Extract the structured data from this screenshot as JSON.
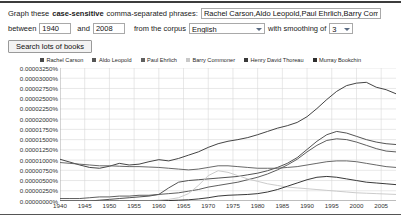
{
  "form": {
    "label_prefix": "Graph these",
    "label_bold": "case-sensitive",
    "label_suffix": "comma-separated phrases:",
    "phrase_value": "Rachel Carson,Aldo Leopold,Paul Ehrlich,Barry Commoner,Henry D",
    "phrase_placeholder": "",
    "between_label": "between",
    "start_year": "1940",
    "and_label": "and",
    "end_year": "2008",
    "corpus_label": "from the corpus",
    "corpus_value": "English",
    "corpus_options": [
      "English"
    ],
    "smoothing_label": "with smoothing of",
    "smoothing_value": "3",
    "smoothing_options": [
      "3"
    ],
    "search_button": "Search lots of books"
  },
  "legend": [
    {
      "label": "Rachel Carson",
      "color": "#4a4a4a"
    },
    {
      "label": "Aldo Leopold",
      "color": "#555555"
    },
    {
      "label": "Paul Ehrlich",
      "color": "#606060"
    },
    {
      "label": "Barry Commoner",
      "color": "#c8c8c8"
    },
    {
      "label": "Henry David Thoreau",
      "color": "#3a3a3a"
    },
    {
      "label": "Murray Bookchin",
      "color": "#2e2e2e"
    }
  ],
  "chart_data": {
    "type": "line",
    "title": "",
    "xlabel": "",
    "ylabel": "",
    "grid": true,
    "legend_position": "top",
    "xlim": [
      1940,
      2008
    ],
    "ylim": [
      0.0,
      3.25e-05
    ],
    "x_ticks": [
      1940,
      1945,
      1950,
      1955,
      1960,
      1965,
      1970,
      1975,
      1980,
      1985,
      1990,
      1995,
      2000,
      2005
    ],
    "y_ticks": [
      "0.00000000%",
      "0.00000250%",
      "0.00000500%",
      "0.00000750%",
      "0.00001000%",
      "0.00001250%",
      "0.00001500%",
      "0.00001750%",
      "0.00002000%",
      "0.00002250%",
      "0.00002500%",
      "0.00002750%",
      "0.00003000%",
      "0.00003250%"
    ],
    "y_tick_values": [
      0,
      2.5e-06,
      5e-06,
      7.5e-06,
      1e-05,
      1.25e-05,
      1.5e-05,
      1.75e-05,
      2e-05,
      2.25e-05,
      2.5e-05,
      2.75e-05,
      3e-05,
      3.25e-05
    ],
    "x": [
      1940,
      1942,
      1944,
      1946,
      1948,
      1950,
      1952,
      1954,
      1956,
      1958,
      1960,
      1962,
      1964,
      1966,
      1968,
      1970,
      1972,
      1974,
      1976,
      1978,
      1980,
      1982,
      1984,
      1986,
      1988,
      1990,
      1992,
      1994,
      1996,
      1998,
      2000,
      2002,
      2004,
      2006,
      2008
    ],
    "series": [
      {
        "name": "Henry David Thoreau",
        "color": "#3a3a3a",
        "values": [
          1.02e-05,
          9.5e-06,
          8.8e-06,
          8.2e-06,
          8e-06,
          8.5e-06,
          9.2e-06,
          8.8e-06,
          9e-06,
          9.6e-06,
          1.01e-05,
          9.8e-06,
          1.04e-05,
          1.12e-05,
          1.2e-05,
          1.31e-05,
          1.4e-05,
          1.46e-05,
          1.5e-05,
          1.55e-05,
          1.62e-05,
          1.7e-05,
          1.78e-05,
          1.84e-05,
          1.92e-05,
          2.06e-05,
          2.26e-05,
          2.48e-05,
          2.68e-05,
          2.82e-05,
          2.88e-05,
          2.9e-05,
          2.78e-05,
          2.72e-05,
          2.62e-05
        ]
      },
      {
        "name": "Rachel Carson",
        "color": "#4a4a4a",
        "values": [
          0.0,
          0.0,
          0.0,
          0.0,
          2e-07,
          4e-07,
          6e-07,
          8e-07,
          1e-06,
          1.2e-06,
          1.6e-06,
          3.2e-06,
          4.6e-06,
          5e-06,
          5.2e-06,
          5.4e-06,
          5.6e-06,
          5.8e-06,
          6e-06,
          6.4e-06,
          6.8e-06,
          7.4e-06,
          8.2e-06,
          9.2e-06,
          1.06e-05,
          1.26e-05,
          1.46e-05,
          1.62e-05,
          1.7e-05,
          1.66e-05,
          1.58e-05,
          1.5e-05,
          1.44e-05,
          1.4e-05,
          1.38e-05
        ]
      },
      {
        "name": "Aldo Leopold",
        "color": "#555555",
        "values": [
          6e-07,
          6e-07,
          6e-07,
          8e-07,
          1e-06,
          1e-06,
          1.2e-06,
          1.2e-06,
          1.4e-06,
          1.4e-06,
          1.6e-06,
          1.8e-06,
          2e-06,
          2.4e-06,
          2.8e-06,
          3.4e-06,
          3.8e-06,
          4.2e-06,
          4.6e-06,
          5.2e-06,
          5.8e-06,
          6.6e-06,
          7.6e-06,
          8.8e-06,
          1.02e-05,
          1.2e-05,
          1.36e-05,
          1.48e-05,
          1.52e-05,
          1.5e-05,
          1.44e-05,
          1.36e-05,
          1.28e-05,
          1.22e-05,
          1.2e-05
        ]
      },
      {
        "name": "Paul Ehrlich",
        "color": "#606060",
        "values": [
          9.4e-06,
          9.2e-06,
          9e-06,
          8.8e-06,
          8.6e-06,
          8.6e-06,
          8.5e-06,
          8.4e-06,
          8.4e-06,
          8.3e-06,
          8.2e-06,
          8e-06,
          7.8e-06,
          7.6e-06,
          7.8e-06,
          8.2e-06,
          8.6e-06,
          8.6e-06,
          8.4e-06,
          8.2e-06,
          8e-06,
          8e-06,
          8e-06,
          8.2e-06,
          8.4e-06,
          8.8e-06,
          9.2e-06,
          9.6e-06,
          9.8e-06,
          9.8e-06,
          9.6e-06,
          9.2e-06,
          8.8e-06,
          8.4e-06,
          8.2e-06
        ]
      },
      {
        "name": "Barry Commoner",
        "color": "#c8c8c8",
        "values": [
          0.0,
          0.0,
          0.0,
          0.0,
          0.0,
          0.0,
          0.0,
          0.0,
          0.0,
          1e-07,
          2e-07,
          4e-07,
          8e-07,
          1.8e-06,
          3.8e-06,
          6.2e-06,
          7.4e-06,
          7e-06,
          6.2e-06,
          5.4e-06,
          4.8e-06,
          4.2e-06,
          3.8e-06,
          3.4e-06,
          3.2e-06,
          3e-06,
          2.8e-06,
          2.6e-06,
          2.4e-06,
          2.2e-06,
          2e-06,
          1.9e-06,
          1.8e-06,
          1.7e-06,
          1.6e-06
        ]
      },
      {
        "name": "Murray Bookchin",
        "color": "#2e2e2e",
        "values": [
          0.0,
          0.0,
          0.0,
          0.0,
          0.0,
          0.0,
          0.0,
          0.0,
          0.0,
          0.0,
          0.0,
          1e-07,
          2e-07,
          3e-07,
          5e-07,
          8e-07,
          1.2e-06,
          1.4e-06,
          1.5e-06,
          1.6e-06,
          1.8e-06,
          2.2e-06,
          2.8e-06,
          3.6e-06,
          4.4e-06,
          5.2e-06,
          5.8e-06,
          6e-06,
          5.8e-06,
          5.4e-06,
          5e-06,
          4.6e-06,
          4.4e-06,
          4.2e-06,
          4e-06
        ]
      }
    ]
  }
}
